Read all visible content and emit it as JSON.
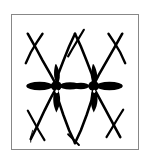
{
  "figure": {
    "description": "Symmetric zigzag lattice of thin black strokes forming X crossings, with two thick asterisk-shaped nodes on a central horizontal band of elliptical lobes.",
    "background_color": "#ffffff",
    "ink_color": "#000000",
    "frame_color": "#878787",
    "frame": {
      "x": 11,
      "y": 14,
      "width": 128,
      "height": 136,
      "border_width": 1
    },
    "canvas": {
      "width": 128,
      "height": 136
    },
    "chart_data": {
      "type": "scatter",
      "title": "Abstract black ink lattice pattern",
      "xlabel": "",
      "ylabel": "",
      "xlim": [
        0,
        128
      ],
      "ylim": [
        0,
        136
      ],
      "grid": false,
      "legend": "none",
      "nodes": [
        {
          "name": "node-left",
          "x": 45,
          "y": 72,
          "kind": "asterisk-node"
        },
        {
          "name": "node-right",
          "x": 83,
          "y": 72,
          "kind": "asterisk-node"
        }
      ],
      "crossings": [
        {
          "name": "crossing-top-left",
          "x": 22,
          "y": 26,
          "kind": "x-crossing"
        },
        {
          "name": "crossing-top-center",
          "x": 64,
          "y": 24,
          "kind": "x-crossing"
        },
        {
          "name": "crossing-top-right",
          "x": 107,
          "y": 26,
          "kind": "x-crossing"
        },
        {
          "name": "crossing-bottom-left",
          "x": 26,
          "y": 114,
          "kind": "x-crossing"
        },
        {
          "name": "crossing-bottom-center",
          "x": 64,
          "y": 118,
          "kind": "x-crossing"
        },
        {
          "name": "crossing-bottom-right",
          "x": 102,
          "y": 112,
          "kind": "x-crossing"
        }
      ],
      "lobes": [
        {
          "name": "lobe-far-left",
          "cx": 28,
          "cy": 72,
          "rx": 13,
          "ry": 4.2
        },
        {
          "name": "lobe-mid-left",
          "cx": 60,
          "cy": 72,
          "rx": 11,
          "ry": 3.6
        },
        {
          "name": "lobe-mid-right",
          "cx": 69,
          "cy": 72,
          "rx": 8,
          "ry": 3.2
        },
        {
          "name": "lobe-far-right",
          "cx": 99,
          "cy": 72,
          "rx": 13,
          "ry": 4.2
        }
      ],
      "strokes": [
        {
          "name": "stroke-tl-down",
          "x1": 16,
          "y1": 20,
          "x2": 47,
          "y2": 74
        },
        {
          "name": "stroke-tl-up",
          "x1": 30,
          "y1": 20,
          "x2": 14,
          "y2": 48
        },
        {
          "name": "stroke-tc-down-left",
          "x1": 64,
          "y1": 18,
          "x2": 44,
          "y2": 74
        },
        {
          "name": "stroke-tc-down-right",
          "x1": 64,
          "y1": 18,
          "x2": 86,
          "y2": 74
        },
        {
          "name": "stroke-tc-tick",
          "x1": 72,
          "y1": 16,
          "x2": 58,
          "y2": 40
        },
        {
          "name": "stroke-tr-down",
          "x1": 112,
          "y1": 20,
          "x2": 84,
          "y2": 74
        },
        {
          "name": "stroke-tr-up",
          "x1": 100,
          "y1": 20,
          "x2": 116,
          "y2": 48
        },
        {
          "name": "stroke-bl-up",
          "x1": 18,
          "y1": 126,
          "x2": 44,
          "y2": 74
        },
        {
          "name": "stroke-bl-down",
          "x1": 32,
          "y1": 126,
          "x2": 16,
          "y2": 98
        },
        {
          "name": "stroke-bc-up-left",
          "x1": 64,
          "y1": 130,
          "x2": 44,
          "y2": 74
        },
        {
          "name": "stroke-bc-up-right",
          "x1": 64,
          "y1": 130,
          "x2": 86,
          "y2": 74
        },
        {
          "name": "stroke-br-up",
          "x1": 110,
          "y1": 124,
          "x2": 84,
          "y2": 74
        },
        {
          "name": "stroke-br-down",
          "x1": 96,
          "y1": 124,
          "x2": 114,
          "y2": 98
        }
      ]
    }
  }
}
